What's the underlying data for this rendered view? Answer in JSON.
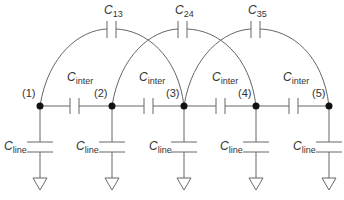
{
  "diagram": {
    "type": "capacitive-coupling-circuit",
    "colors": {
      "wire": "#666666",
      "node": "#111111",
      "text": "#333333",
      "background": "#ffffff"
    },
    "nodes": [
      {
        "label": "(1)",
        "x": 40,
        "y": 106
      },
      {
        "label": "(2)",
        "x": 112,
        "y": 106
      },
      {
        "label": "(3)",
        "x": 184,
        "y": 106
      },
      {
        "label": "(4)",
        "x": 256,
        "y": 106
      },
      {
        "label": "(5)",
        "x": 329,
        "y": 106
      }
    ],
    "long_range_caps": [
      {
        "base": "C",
        "sub": "13"
      },
      {
        "base": "C",
        "sub": "24"
      },
      {
        "base": "C",
        "sub": "35"
      }
    ],
    "inter_caps": [
      {
        "base": "C",
        "sub": "inter"
      },
      {
        "base": "C",
        "sub": "inter"
      },
      {
        "base": "C",
        "sub": "inter"
      },
      {
        "base": "C",
        "sub": "inter"
      }
    ],
    "line_caps": [
      {
        "base": "C",
        "sub": "line"
      },
      {
        "base": "C",
        "sub": "line"
      },
      {
        "base": "C",
        "sub": "line"
      },
      {
        "base": "C",
        "sub": "line"
      },
      {
        "base": "C",
        "sub": "line"
      }
    ]
  }
}
